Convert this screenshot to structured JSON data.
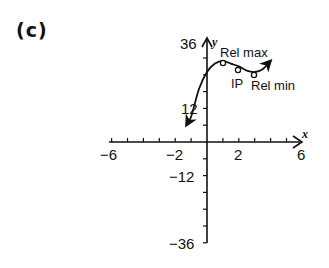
{
  "panel": {
    "label": "(c)"
  },
  "axes": {
    "x_label": "x",
    "y_label": "y",
    "x_tick_labels": [
      "-6",
      "-2",
      "2",
      "6"
    ],
    "y_tick_labels": [
      "36",
      "12",
      "-12",
      "-36"
    ]
  },
  "annotations": {
    "rel_max": "Rel max",
    "ip": "IP",
    "rel_min": "Rel min"
  },
  "chart_data": {
    "type": "line",
    "title": "(c)",
    "xlabel": "x",
    "ylabel": "y",
    "xlim": [
      -6,
      6
    ],
    "ylim": [
      -36,
      36
    ],
    "x_ticks": [
      -6,
      -5,
      -4,
      -3,
      -2,
      -1,
      0,
      1,
      2,
      3,
      4,
      5,
      6
    ],
    "x_tick_labels": [
      "-6",
      "-2",
      "2",
      "6"
    ],
    "y_ticks": [
      -36,
      -30,
      -24,
      -18,
      -12,
      -6,
      0,
      6,
      12,
      18,
      24,
      30,
      36
    ],
    "y_tick_labels": [
      "36",
      "12",
      "-12",
      "-36"
    ],
    "grid": false,
    "series": [
      {
        "name": "f(x)",
        "x": [
          -1.3,
          -1,
          -0.5,
          0,
          0.5,
          1,
          1.5,
          2,
          2.5,
          3,
          3.5,
          4
        ],
        "y": [
          6,
          9,
          19,
          25,
          28,
          29,
          28,
          27,
          25.5,
          25,
          26,
          29
        ],
        "arrows_at_ends": true
      }
    ],
    "annotations": [
      {
        "text": "Rel max",
        "x": 1,
        "y": 29
      },
      {
        "text": "IP",
        "x": 2,
        "y": 27
      },
      {
        "text": "Rel min",
        "x": 3,
        "y": 25
      }
    ]
  }
}
